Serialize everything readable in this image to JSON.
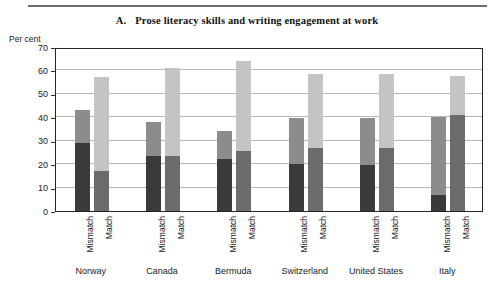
{
  "title": {
    "letter": "A.",
    "text": "Prose literacy skills and writing engagement at work"
  },
  "axis_unit_label": "Per cent",
  "series_labels": {
    "mismatch": "Mismatch",
    "match": "Match"
  },
  "colors": {
    "mismatch_lower": "#3a3a3a",
    "mismatch_upper": "#8c8c8c",
    "match_lower": "#6b6b6b",
    "match_upper": "#c4c4c4",
    "gridline": "#b9b9b9",
    "frame": "#262626",
    "rule": "#6e6e6e"
  },
  "chart_data": {
    "type": "bar",
    "subtype": "stacked-grouped",
    "xlabel": "",
    "ylabel": "Per cent",
    "ylim": [
      0,
      70
    ],
    "yticks": [
      0,
      10,
      20,
      30,
      40,
      50,
      60,
      70
    ],
    "grid": true,
    "legend": "none",
    "categories": [
      "Norway",
      "Canada",
      "Bermuda",
      "Switzerland",
      "United States",
      "Italy"
    ],
    "subcategories": [
      "Mismatch",
      "Match"
    ],
    "series": [
      {
        "name": "Mismatch - lower segment",
        "subcategory": "Mismatch",
        "stack": "lower",
        "values": [
          29,
          23.5,
          22,
          20,
          19.5,
          7
        ]
      },
      {
        "name": "Mismatch - upper segment",
        "subcategory": "Mismatch",
        "stack": "upper",
        "values": [
          14,
          14.5,
          12,
          19.5,
          20,
          33
        ]
      },
      {
        "name": "Match - lower segment",
        "subcategory": "Match",
        "stack": "lower",
        "values": [
          17,
          23.5,
          25.5,
          27,
          27,
          41
        ]
      },
      {
        "name": "Match - upper segment",
        "subcategory": "Match",
        "stack": "upper",
        "values": [
          40,
          37.5,
          38.5,
          31.5,
          31.5,
          16.5
        ]
      }
    ],
    "totals": {
      "Mismatch": [
        43,
        38,
        34,
        39.5,
        39.5,
        40
      ],
      "Match": [
        57,
        61,
        64,
        58.5,
        58.5,
        57.5
      ]
    }
  }
}
